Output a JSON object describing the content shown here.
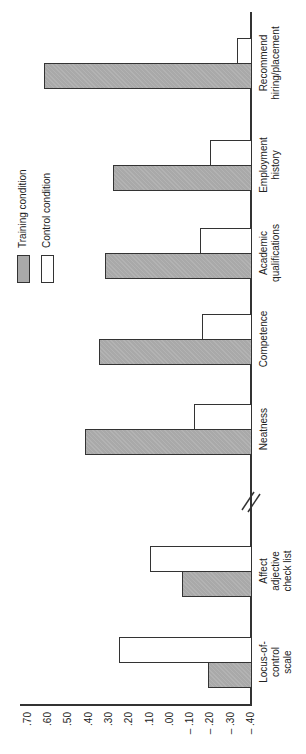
{
  "chart_data": {
    "type": "bar",
    "orientation": "rotated 90 degrees counter-clockwise (vertical bar chart printed sideways)",
    "title": "",
    "xlabel": "",
    "ylabel": "",
    "ylim": [
      -0.4,
      0.7
    ],
    "y_ticks": [
      ".70",
      ".60",
      ".50",
      ".40",
      ".30",
      ".20",
      ".10",
      ".00",
      "-.10",
      "-.20",
      "-.30",
      "-.40"
    ],
    "grid": false,
    "axis_break": "between Affect adjective check list and Neatness",
    "legend": {
      "position": "upper left (rotated)",
      "entries": [
        "Training condition",
        "Control condition"
      ]
    },
    "categories": [
      "Locus-of-control scale",
      "Affect adjective check list",
      "Neatness",
      "Competence",
      "Academic qualifications",
      "Employment history",
      "Recommend hiring/placement"
    ],
    "series": [
      {
        "name": "Training condition",
        "color": "#a9a9a9",
        "values": [
          -0.19,
          -0.06,
          0.42,
          0.35,
          0.32,
          0.28,
          0.62
        ]
      },
      {
        "name": "Control condition",
        "color": "#ffffff",
        "values": [
          0.25,
          0.1,
          -0.12,
          -0.16,
          -0.15,
          -0.2,
          -0.33
        ]
      }
    ]
  },
  "labels": {
    "categories_display": [
      [
        "Locus-of-",
        "control",
        "scale"
      ],
      [
        "Affect",
        "adjective",
        "check list"
      ],
      [
        "Neatness"
      ],
      [
        "Competence"
      ],
      [
        "Academic",
        "qualifications"
      ],
      [
        "Employment",
        "history"
      ],
      [
        "Recommend",
        "hiring/placement"
      ]
    ],
    "legend_training": "Training condition",
    "legend_control": "Control condition"
  }
}
